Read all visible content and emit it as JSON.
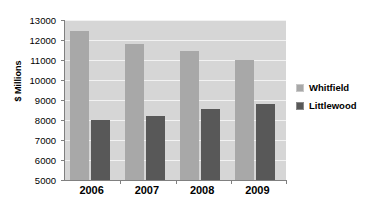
{
  "chart_data": {
    "type": "bar",
    "title": "",
    "subtitle": "",
    "xlabel": "",
    "ylabel": "$ Millions",
    "categories": [
      "2006",
      "2007",
      "2008",
      "2009"
    ],
    "series": [
      {
        "name": "Whitfield",
        "color": "#a8a8a8",
        "values": [
          12450,
          11800,
          11450,
          10980
        ]
      },
      {
        "name": "Littlewood",
        "color": "#585858",
        "values": [
          7990,
          8200,
          8570,
          8780
        ]
      }
    ],
    "ylim": [
      5000,
      13000
    ],
    "ytick_step": 1000,
    "yticks": [
      5000,
      6000,
      7000,
      8000,
      9000,
      10000,
      11000,
      12000,
      13000
    ],
    "ytick_labels": [
      "5000",
      "6000",
      "7000",
      "8000",
      "9000",
      "10000",
      "11000",
      "12000",
      "13000"
    ],
    "grid": true,
    "grid_axis": "y",
    "legend_position": "right",
    "plot_background": "#d6d6d6",
    "gridline_color": "#f2f2f2",
    "axis_color": "#808080",
    "figure_background": "#ffffff"
  }
}
